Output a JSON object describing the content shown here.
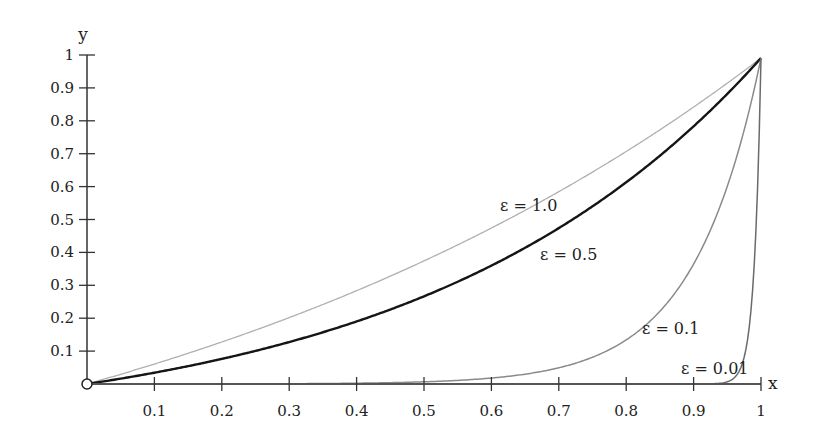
{
  "chart_data": {
    "type": "line",
    "title": "",
    "xlabel": "x",
    "ylabel": "y",
    "xlim": [
      0,
      1
    ],
    "ylim": [
      0,
      1
    ],
    "grid": false,
    "legend": "inline labels",
    "x_ticks": [
      "0.1",
      "0.2",
      "0.3",
      "0.4",
      "0.5",
      "0.6",
      "0.7",
      "0.8",
      "0.9",
      "1"
    ],
    "y_ticks": [
      "0.1",
      "0.2",
      "0.3",
      "0.4",
      "0.5",
      "0.6",
      "0.7",
      "0.8",
      "0.9",
      "1"
    ],
    "x": [
      0,
      0.1,
      0.2,
      0.3,
      0.4,
      0.5,
      0.6,
      0.7,
      0.8,
      0.9,
      0.95,
      0.98,
      0.99,
      1.0
    ],
    "series": [
      {
        "name": "ε = 1.0",
        "epsilon": 1.0,
        "color": "#b0b0b0",
        "width": 1.3,
        "values": [
          0,
          0.061,
          0.129,
          0.204,
          0.286,
          0.378,
          0.479,
          0.591,
          0.714,
          0.851,
          0.924,
          0.969,
          0.984,
          1.0
        ]
      },
      {
        "name": "ε = 0.5",
        "epsilon": 0.5,
        "color": "#151515",
        "width": 2.4,
        "values": [
          0,
          0.035,
          0.077,
          0.129,
          0.191,
          0.269,
          0.365,
          0.482,
          0.626,
          0.802,
          0.901,
          0.96,
          0.98,
          1.0
        ]
      },
      {
        "name": "ε = 0.1",
        "epsilon": 0.1,
        "color": "#8a8a8a",
        "width": 1.5,
        "values": [
          0,
          0.0001,
          0.0003,
          0.0009,
          0.0025,
          0.0067,
          0.018,
          0.05,
          0.135,
          0.368,
          0.607,
          0.819,
          0.905,
          1.0
        ]
      },
      {
        "name": "ε = 0.01",
        "epsilon": 0.01,
        "color": "#6a6a6a",
        "width": 1.5,
        "values": [
          0,
          0,
          0,
          0,
          0,
          0,
          0,
          0,
          0,
          0,
          0.0067,
          0.135,
          0.368,
          1.0
        ]
      }
    ],
    "annotations": [
      {
        "text": "ε = 1.0",
        "x": 0.66,
        "y": 0.54
      },
      {
        "text": "ε = 0.5",
        "x": 0.71,
        "y": 0.39
      },
      {
        "text": "ε = 0.1",
        "x": 0.84,
        "y": 0.17
      },
      {
        "text": "ε = 0.01",
        "x": 0.885,
        "y": 0.05
      }
    ],
    "origin_marker": "open-circle"
  },
  "axes": {
    "x_label": "x",
    "y_label": "y"
  },
  "labels": {
    "eps_1_0": "ε = 1.0",
    "eps_0_5": "ε = 0.5",
    "eps_0_1": "ε = 0.1",
    "eps_0_01": "ε = 0.01"
  }
}
